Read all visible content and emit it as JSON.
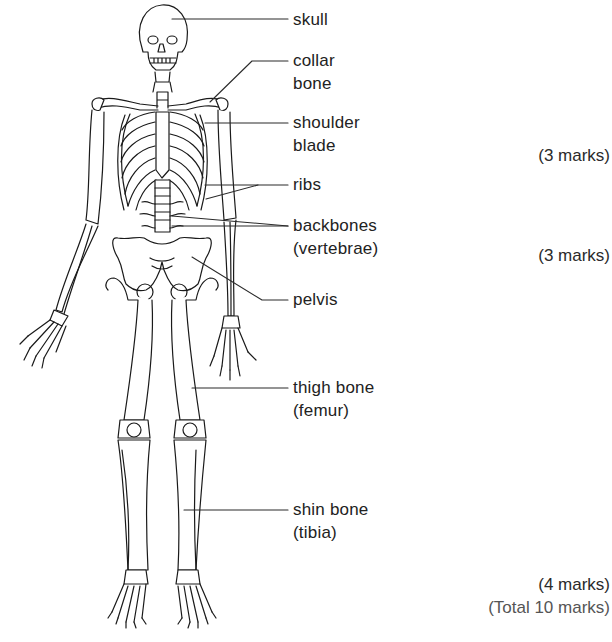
{
  "diagram": {
    "labels": [
      {
        "id": "skull",
        "line1": "skull",
        "line2": ""
      },
      {
        "id": "collar-bone",
        "line1": "collar",
        "line2": "bone"
      },
      {
        "id": "shoulder-blade",
        "line1": "shoulder",
        "line2": "blade"
      },
      {
        "id": "ribs",
        "line1": "ribs",
        "line2": ""
      },
      {
        "id": "backbones",
        "line1": "backbones",
        "line2": "(vertebrae)"
      },
      {
        "id": "pelvis",
        "line1": "pelvis",
        "line2": ""
      },
      {
        "id": "thigh-bone",
        "line1": "thigh bone",
        "line2": "(femur)"
      },
      {
        "id": "shin-bone",
        "line1": "shin bone",
        "line2": "(tibia)"
      }
    ],
    "marks": [
      {
        "text": "(3 marks)"
      },
      {
        "text": "(3 marks)"
      },
      {
        "text": "(4 marks)"
      }
    ],
    "total": "(Total 10 marks)",
    "colors": {
      "line": "#1a1a1a",
      "background": "#ffffff",
      "total_text": "#555555"
    }
  }
}
